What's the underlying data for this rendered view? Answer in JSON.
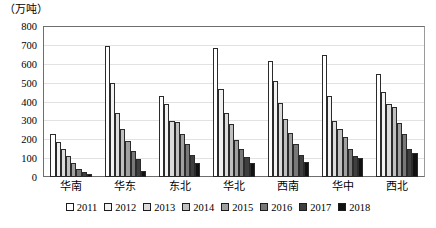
{
  "chart_data": {
    "type": "bar",
    "title": "",
    "subtitle": "",
    "xlabel": "",
    "ylabel": "（万吨）",
    "ylim": [
      0,
      800
    ],
    "ytick_step": 100,
    "yticks": [
      800,
      700,
      600,
      500,
      400,
      300,
      200,
      100,
      0
    ],
    "grid": true,
    "legend_position": "bottom",
    "categories": [
      "华南",
      "华东",
      "东北",
      "华北",
      "西南",
      "华中",
      "西北"
    ],
    "series": [
      {
        "name": "2011",
        "color": "#ffffff",
        "values": [
          230,
          700,
          430,
          690,
          620,
          650,
          550
        ]
      },
      {
        "name": "2012",
        "color": "#f2f2f2",
        "values": [
          185,
          500,
          390,
          470,
          510,
          430,
          455
        ]
      },
      {
        "name": "2013",
        "color": "#dcdcdc",
        "values": [
          150,
          340,
          300,
          340,
          395,
          300,
          390
        ]
      },
      {
        "name": "2014",
        "color": "#c0c0c0",
        "values": [
          110,
          255,
          295,
          285,
          310,
          255,
          375
        ]
      },
      {
        "name": "2015",
        "color": "#a0a0a0",
        "values": [
          75,
          190,
          230,
          200,
          235,
          215,
          290
        ]
      },
      {
        "name": "2016",
        "color": "#787878",
        "values": [
          45,
          140,
          175,
          150,
          175,
          150,
          230
        ]
      },
      {
        "name": "2017",
        "color": "#3f3f3f",
        "values": [
          28,
          95,
          120,
          105,
          120,
          110,
          150
        ]
      },
      {
        "name": "2018",
        "color": "#111111",
        "values": [
          15,
          30,
          75,
          75,
          80,
          100,
          130
        ]
      }
    ]
  },
  "axis": {
    "unit_caption": "（万吨）"
  }
}
